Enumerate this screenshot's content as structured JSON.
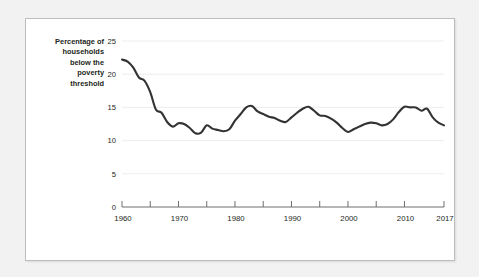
{
  "figure": {
    "background_color": "#ffffff",
    "page_background_color": "#f2f2f2",
    "border_color": "#bdbdbd"
  },
  "chart_data": {
    "type": "line",
    "title": "",
    "subtitle": "",
    "xlabel": "",
    "ylabel": "Percentage of households below the poverty threshold",
    "ylabel_lines": [
      "Percentage of",
      "households",
      "below the",
      "poverty",
      "threshold"
    ],
    "xlim": [
      1960,
      2017
    ],
    "ylim": [
      0,
      25
    ],
    "yticks": [
      0,
      5,
      10,
      15,
      20,
      25
    ],
    "ytick_labels": [
      "0",
      "5",
      "10",
      "15",
      "20",
      "25"
    ],
    "xticks": [
      1960,
      1970,
      1980,
      1990,
      2000,
      2010,
      2017
    ],
    "xtick_labels": [
      "1960",
      "1970",
      "1980",
      "1990",
      "2000",
      "2010",
      "2017"
    ],
    "minor_xticks": [
      1965,
      1975,
      1985,
      1995,
      2005
    ],
    "grid": "horizontal",
    "legend": "none",
    "line_color": "#333333",
    "series": [
      {
        "name": "Percentage of households below the poverty threshold",
        "x": [
          1960,
          1961,
          1962,
          1963,
          1964,
          1965,
          1966,
          1967,
          1968,
          1969,
          1970,
          1971,
          1972,
          1973,
          1974,
          1975,
          1976,
          1977,
          1978,
          1979,
          1980,
          1981,
          1982,
          1983,
          1984,
          1985,
          1986,
          1987,
          1988,
          1989,
          1990,
          1991,
          1992,
          1993,
          1994,
          1995,
          1996,
          1997,
          1998,
          1999,
          2000,
          2001,
          2002,
          2003,
          2004,
          2005,
          2006,
          2007,
          2008,
          2009,
          2010,
          2011,
          2012,
          2013,
          2014,
          2015,
          2016,
          2017
        ],
        "values": [
          22.2,
          21.9,
          21.0,
          19.5,
          19.0,
          17.3,
          14.7,
          14.2,
          12.8,
          12.1,
          12.6,
          12.5,
          11.9,
          11.1,
          11.2,
          12.3,
          11.8,
          11.6,
          11.4,
          11.7,
          13.0,
          14.0,
          15.0,
          15.2,
          14.4,
          14.0,
          13.6,
          13.4,
          13.0,
          12.8,
          13.5,
          14.2,
          14.8,
          15.1,
          14.5,
          13.8,
          13.7,
          13.3,
          12.7,
          11.9,
          11.3,
          11.7,
          12.1,
          12.5,
          12.7,
          12.6,
          12.3,
          12.5,
          13.2,
          14.3,
          15.1,
          15.0,
          15.0,
          14.5,
          14.8,
          13.5,
          12.7,
          12.3
        ]
      }
    ]
  }
}
